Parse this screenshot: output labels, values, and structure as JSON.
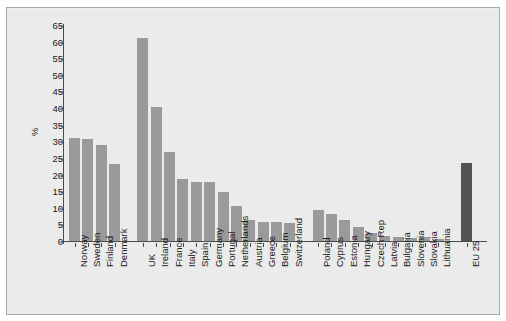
{
  "chart_data": {
    "type": "bar",
    "title": "",
    "subtitle": "",
    "xlabel": "",
    "ylabel": "%",
    "ylim": [
      0,
      65
    ],
    "yticks": [
      0,
      5,
      10,
      15,
      20,
      25,
      30,
      35,
      40,
      45,
      50,
      55,
      60,
      65
    ],
    "grid": false,
    "legend": null,
    "categories": [
      "Norway",
      "Sweden",
      "Finland",
      "Denmark",
      "UK",
      "Ireland",
      "France",
      "Italy",
      "Spain",
      "Germany",
      "Portugal",
      "Netherlands",
      "Austria",
      "Greece",
      "Belgium",
      "Switzerland",
      "Poland",
      "Cyprus",
      "Estonia",
      "Hungary",
      "Czech Rep",
      "Latvia",
      "Bulgaria",
      "Slovenia",
      "Slovakia",
      "Lithuania",
      "EU 25"
    ],
    "values": [
      31.1,
      30.7,
      28.8,
      23.1,
      61.0,
      40.3,
      26.8,
      18.6,
      17.9,
      17.7,
      14.9,
      10.5,
      6.2,
      5.8,
      5.6,
      5.3,
      9.3,
      8.0,
      6.2,
      4.3,
      2.3,
      1.4,
      1.1,
      1.0,
      1.1,
      0.7,
      23.5
    ],
    "group_breaks_after": [
      3,
      15,
      25
    ],
    "bar_colors": {
      "default": "#9a9a9a",
      "accent": "#545454",
      "accent_category": "EU 25"
    },
    "background_color": "#ebebeb",
    "axis_color": "#4a4a4a",
    "text_color": "#1a1a1a"
  }
}
